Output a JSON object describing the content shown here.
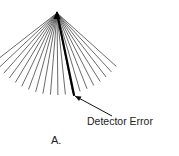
{
  "figure": {
    "annotation_label": "Detector Error",
    "panel_label": "A.",
    "colors": {
      "fan_line": "#444444",
      "error_line": "#000000",
      "arrow": "#111111",
      "background": "#ffffff"
    },
    "fan": {
      "apex": [
        57,
        13
      ],
      "line_count": 20,
      "angle_start_deg": -52,
      "angle_end_deg": 48,
      "length": 82
    },
    "error_ray": {
      "from": [
        57,
        13
      ],
      "to": [
        74,
        95
      ]
    },
    "arrow": {
      "from": [
        112,
        116
      ],
      "to": [
        75,
        96
      ]
    }
  }
}
